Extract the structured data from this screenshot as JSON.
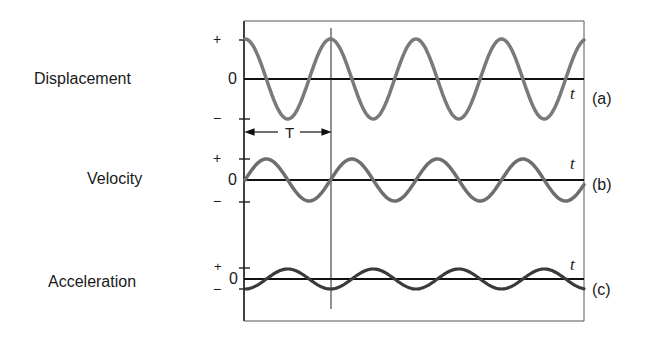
{
  "labels": {
    "displacement": "Displacement",
    "velocity": "Velocity",
    "acceleration": "Acceleration"
  },
  "axis": {
    "plus": "+",
    "minus": "−",
    "zero": "0",
    "time_symbol": "t",
    "period_symbol": "T"
  },
  "panels": {
    "a": "(a)",
    "b": "(b)",
    "c": "(c)"
  },
  "colors": {
    "wave_displacement": "#7a7a7a",
    "wave_velocity": "#6e6e6e",
    "wave_acceleration": "#3a3a3a",
    "axis": "#111111"
  },
  "chart_data": {
    "type": "line",
    "title": "",
    "xlabel": "t",
    "series": [
      {
        "name": "Displacement",
        "panel": "(a)",
        "function": "A cos(ωt)",
        "amplitude_relative": 1.0,
        "start": "+max"
      },
      {
        "name": "Velocity",
        "panel": "(b)",
        "function": "sin-shaped, starting at 0",
        "amplitude_relative": 0.55,
        "start": "0 rising"
      },
      {
        "name": "Acceleration",
        "panel": "(c)",
        "function": "−A cos(ωt)",
        "amplitude_relative": 0.27,
        "start": "−max"
      }
    ],
    "period_label": "T",
    "cycles_shown": 4,
    "grid": false
  }
}
